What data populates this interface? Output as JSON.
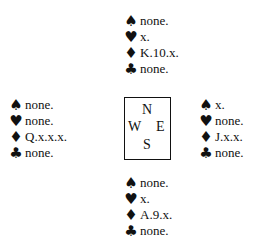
{
  "hands": {
    "north": {
      "spades": "none.",
      "hearts": "x.",
      "diamonds": "K.10.x.",
      "clubs": "none."
    },
    "west": {
      "spades": "none.",
      "hearts": "none.",
      "diamonds": "Q.x.x.x.",
      "clubs": "none."
    },
    "east": {
      "spades": "x.",
      "hearts": "none.",
      "diamonds": "J.x.x.",
      "clubs": "none."
    },
    "south": {
      "spades": "none.",
      "hearts": "x.",
      "diamonds": "A.9.x.",
      "clubs": "none."
    }
  },
  "suits": {
    "spades": "♠",
    "hearts": "♥",
    "diamonds": "♦",
    "clubs": "♣"
  },
  "compass": {
    "n": "N",
    "w": "W",
    "e": "E",
    "s": "S"
  }
}
